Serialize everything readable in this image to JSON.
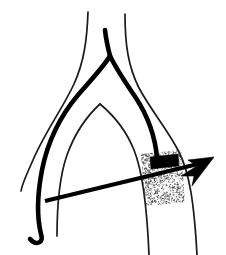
{
  "figure": {
    "background_color": "#ffffff",
    "ink_color": "#000000",
    "thin_line_color": "#1a1a1a",
    "canvas": {
      "width": 226,
      "height": 255
    }
  },
  "elements": {
    "outer_wall_left": {
      "name": "outer-wall-left",
      "stroke_width": 1.7,
      "path": "M 88 12 C 87 40 84 62 74 84 C 63 108 45 132 33 160 C 26 176 22 184 21 191"
    },
    "outer_wall_right": {
      "name": "outer-wall-right",
      "stroke_width": 1.7,
      "path": "M 125 14 C 125 44 128 66 139 88 C 152 112 168 130 179 152 C 189 172 194 200 197 255"
    },
    "inner_arch_left": {
      "name": "inner-arch-left",
      "stroke_width": 1.7,
      "path": "M 100 104 C 88 115 75 133 67 155 C 60 175 57 205 57 236"
    },
    "inner_arch_right": {
      "name": "inner-arch-right",
      "stroke_width": 1.7,
      "path": "M 100 104 C 112 114 126 130 134 150 C 142 170 147 206 149 255"
    },
    "core_trunk": {
      "name": "core-trunk-thick",
      "stroke_width": 4.6,
      "path": "M 105 30 C 106 40 108 48 110 56"
    },
    "core_branch_left": {
      "name": "core-branch-left-thick",
      "stroke_width": 4.6,
      "path": "M 110 56 C 104 66 92 79 78 95 C 62 114 48 140 42 170 C 37 196 37 218 41 234 C 44 243 36 246 30 239"
    },
    "core_branch_right": {
      "name": "core-branch-right-thick",
      "stroke_width": 4.6,
      "path": "M 110 56 C 116 68 125 82 136 98 C 147 115 155 134 157 158"
    },
    "stipple_band": {
      "name": "stipple-band",
      "label": "stippled lesion band",
      "x": 141,
      "y": 154,
      "width": 40,
      "height": 52,
      "skew_offset": 4,
      "dot_color": "#3a3a3a",
      "dot_count": 1500
    },
    "occlusion_bar": {
      "name": "occlusion-bar",
      "label": "solid black occlusion marker",
      "points": "150,157 178,154 179,166 151,169"
    },
    "arrow": {
      "name": "direction-arrow",
      "label": "flow direction arrow",
      "shaft_path": "M 45 201 L 198 164",
      "head_points": "214 157 188 160 197 166 181 176 194 176 192 186",
      "direction": "up-right"
    }
  }
}
